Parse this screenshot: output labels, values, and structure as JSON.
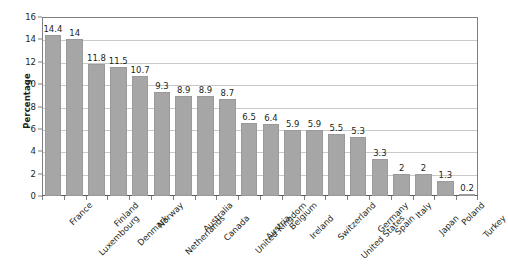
{
  "chart_data": {
    "type": "bar",
    "title": "",
    "subtitle": "",
    "xlabel": "",
    "ylabel": "Percentage",
    "ylim": [
      0,
      16
    ],
    "ytick_step": 2,
    "yticks": [
      16,
      14,
      12,
      10,
      8,
      6,
      4,
      2,
      0
    ],
    "grid": true,
    "grid_axis": "y",
    "legend": false,
    "legend_position": "none",
    "orientation": "vertical",
    "sorted": "descending",
    "bar_color": "#a6a6a6",
    "categories": [
      "France",
      "Luxembourg",
      "Finland",
      "Denmark",
      "Norway",
      "Netherlands",
      "Australia",
      "Canada",
      "United Kingdom",
      "Austria",
      "Belgium",
      "Ireland",
      "Switzerland",
      "United States",
      "Germany",
      "Spain",
      "Italy",
      "Japan",
      "Poland",
      "Turkey"
    ],
    "values": [
      14.4,
      14,
      11.8,
      11.5,
      10.7,
      9.3,
      8.9,
      8.9,
      8.7,
      6.5,
      6.4,
      5.9,
      5.9,
      5.5,
      5.3,
      3.3,
      2,
      2,
      1.3,
      0.2
    ],
    "data_labels": [
      "14.4",
      "14",
      "11.8",
      "11.5",
      "10.7",
      "9.3",
      "8.9",
      "8.9",
      "8.7",
      "6.5",
      "6.4",
      "5.9",
      "5.9",
      "5.5",
      "5.3",
      "3.3",
      "2",
      "2",
      "1.3",
      "0.2"
    ]
  },
  "axis": {
    "y_title": "Percentage"
  },
  "colors": {
    "bar_fill": "#a6a6a6",
    "bar_stroke": "#9a9a9a",
    "gridline": "#c9c9c9",
    "axis": "#808080",
    "text": "#231f20",
    "background": "#ffffff"
  }
}
